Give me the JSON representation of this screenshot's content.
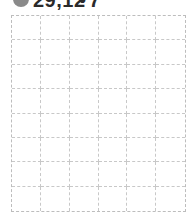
{
  "header": {
    "icon": "circle-icon",
    "value": "29,12",
    "separator": "•",
    "count": "7"
  },
  "grid": {
    "columns": 6,
    "rows": 8,
    "line_color": "#bdbdbd"
  }
}
